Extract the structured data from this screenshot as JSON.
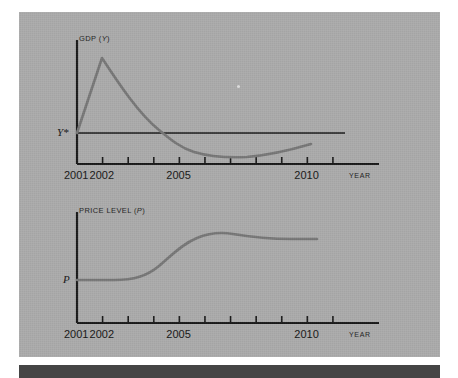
{
  "figure": {
    "background_color": "#ffffff",
    "panel_color": "#aaaaaa",
    "rule_color": "#454545",
    "axis_color": "#171717",
    "curve_color": "#767676",
    "reference_line_color": "#171717"
  },
  "charts": [
    {
      "id": "gdp",
      "y_axis_title_prefix": "GDP (",
      "y_axis_title_symbol": "Y",
      "y_axis_title_suffix": ")",
      "y_reference_label": "Y*",
      "x_axis_title": "YEAR",
      "tick_labels": [
        {
          "text": "2001",
          "year": 2001
        },
        {
          "text": "2002",
          "year": 2002
        },
        {
          "text": "2005",
          "year": 2005
        },
        {
          "text": "2010",
          "year": 2010
        }
      ],
      "tick_years": [
        2001,
        2002,
        2003,
        2004,
        2005,
        2006,
        2007,
        2008,
        2009,
        2010,
        2011
      ],
      "chart_data": {
        "type": "line",
        "title": "GDP (Y)",
        "xlabel": "YEAR",
        "ylabel": "GDP (Y)",
        "xlim": [
          2001,
          2012.8
        ],
        "grid": false,
        "legend": "none",
        "reference_lines": [
          {
            "name": "Y*",
            "value": 1.0,
            "orientation": "horizontal"
          }
        ],
        "series": [
          {
            "name": "GDP (Y)",
            "x": [
              2001.0,
              2001.3,
              2001.7,
              2002.0,
              2002.5,
              2003.0,
              2003.6,
              2004.2,
              2004.7,
              2005.2,
              2005.8,
              2006.4,
              2007.0,
              2007.7,
              2008.4,
              2009.1,
              2009.8,
              2010.5,
              2011.0
            ],
            "y": [
              1.0,
              1.44,
              1.92,
              2.34,
              2.08,
              1.82,
              1.52,
              1.24,
              1.06,
              0.92,
              0.83,
              0.78,
              0.76,
              0.76,
              0.78,
              0.81,
              0.85,
              0.89,
              0.92
            ]
          }
        ]
      }
    },
    {
      "id": "price",
      "y_axis_title_prefix": "PRICE LEVEL (",
      "y_axis_title_symbol": "P",
      "y_axis_title_suffix": ")",
      "y_reference_label": "P",
      "x_axis_title": "YEAR",
      "tick_labels": [
        {
          "text": "2001",
          "year": 2001
        },
        {
          "text": "2002",
          "year": 2002
        },
        {
          "text": "2005",
          "year": 2005
        },
        {
          "text": "2010",
          "year": 2010
        }
      ],
      "tick_years": [
        2001,
        2002,
        2003,
        2004,
        2005,
        2006,
        2007,
        2008,
        2009,
        2010,
        2011
      ],
      "chart_data": {
        "type": "line",
        "title": "PRICE LEVEL (P)",
        "xlabel": "YEAR",
        "ylabel": "PRICE LEVEL (P)",
        "xlim": [
          2001,
          2012.8
        ],
        "grid": false,
        "legend": "none",
        "reference_lines": [],
        "series": [
          {
            "name": "PRICE LEVEL (P)",
            "x": [
              2001.0,
              2001.6,
              2002.2,
              2002.8,
              2003.4,
              2004.0,
              2004.6,
              2005.2,
              2005.8,
              2006.4,
              2007.0,
              2007.6,
              2008.3,
              2009.0,
              2009.7,
              2010.4,
              2011.0
            ],
            "y": [
              1.0,
              1.0,
              1.01,
              1.04,
              1.12,
              1.25,
              1.42,
              1.58,
              1.72,
              1.82,
              1.86,
              1.85,
              1.82,
              1.8,
              1.79,
              1.79,
              1.79
            ]
          }
        ]
      }
    }
  ]
}
